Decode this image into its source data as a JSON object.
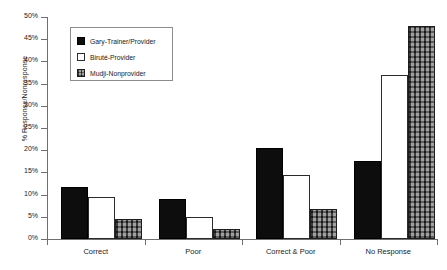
{
  "chart_data": {
    "type": "bar",
    "title": "",
    "subtitle": "",
    "xlabel": "",
    "ylabel": "% Response/Nonresponse",
    "ylim": [
      0,
      50
    ],
    "ytick_labels": [
      "0%",
      "5%",
      "10%",
      "15%",
      "20%",
      "25%",
      "30%",
      "35%",
      "40%",
      "45%",
      "50%"
    ],
    "ytick_values": [
      0,
      5,
      10,
      15,
      20,
      25,
      30,
      35,
      40,
      45,
      50
    ],
    "grid": false,
    "legend_position": "upper-left-inside",
    "categories": [
      "Correct",
      "Poor",
      "Correct & Poor",
      "No Response"
    ],
    "series": [
      {
        "name": "Gary-Trainer/Provider",
        "values": [
          11.7,
          9.0,
          20.5,
          17.5
        ],
        "style": "solid-black"
      },
      {
        "name": "Biruté-Provider",
        "values": [
          9.5,
          5.0,
          14.5,
          37.0
        ],
        "style": "white-outline"
      },
      {
        "name": "Mudji-Nonprovider",
        "values": [
          4.5,
          2.3,
          6.8,
          48.0
        ],
        "style": "crosshatch-gray"
      }
    ]
  },
  "legend": {
    "items": [
      {
        "label": "Gary-Trainer/Provider"
      },
      {
        "label": "Biruté-Provider"
      },
      {
        "label": "Mudji-Nonprovider"
      }
    ]
  },
  "colors": {
    "series_0": "#0d0d0d",
    "series_1": "#ffffff",
    "series_2": "#6e6e6e",
    "axis": "#6f6f6f",
    "text": "#1a1a1a",
    "background": "#ffffff"
  }
}
